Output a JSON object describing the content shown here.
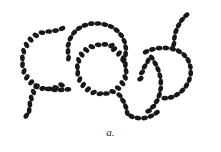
{
  "figure": {
    "caption": "a.",
    "background_color": "#ffffff",
    "cell_color": "#1a1716",
    "cell_count_total": 132,
    "canvas": {
      "width": 221,
      "height": 152
    }
  },
  "chart_data": {
    "type": "scatter",
    "xlabel": "",
    "ylabel": "",
    "xlim": [
      0,
      221
    ],
    "ylim": [
      0,
      152
    ],
    "grid": false,
    "legend": "none",
    "marker_shape": "ellipse",
    "marker_color": "#1a1716",
    "marker_rx": 3.4,
    "marker_ry": 2.35,
    "annotations": [
      "a."
    ],
    "series": [
      {
        "name": "chain-1-left-loop",
        "description": "open C-shaped loop at left, opening to the lower-right, with a tail trailing down-left",
        "points": [
          [
            62.0,
            28.5,
            -22
          ],
          [
            55.5,
            30.6,
            -12
          ],
          [
            48.7,
            31.5,
            -2
          ],
          [
            42.0,
            32.6,
            12
          ],
          [
            35.8,
            35.4,
            30
          ],
          [
            30.6,
            39.6,
            45
          ],
          [
            26.5,
            45.0,
            60
          ],
          [
            23.7,
            51.2,
            74
          ],
          [
            22.4,
            57.9,
            86
          ],
          [
            22.5,
            64.7,
            96
          ],
          [
            24.0,
            71.3,
            108
          ],
          [
            26.9,
            77.3,
            122
          ],
          [
            31.2,
            82.4,
            136
          ],
          [
            36.6,
            86.2,
            150
          ],
          [
            42.7,
            88.4,
            166
          ],
          [
            49.2,
            88.9,
            178
          ],
          [
            55.6,
            87.6,
            193
          ],
          [
            61.5,
            85.0,
            205
          ]
        ]
      },
      {
        "name": "chain-1-tail-lower-left",
        "description": "short tail descending from the left loop toward the bottom-left corner",
        "points": [
          [
            36.4,
            86.2,
            55
          ],
          [
            33.5,
            92.0,
            66
          ],
          [
            31.3,
            98.0,
            76
          ],
          [
            29.9,
            104.2,
            84
          ],
          [
            29.2,
            110.5,
            92
          ],
          [
            26.3,
            115.6,
            125
          ]
        ]
      },
      {
        "name": "chain-1-tail-lower-right",
        "description": "short tail running right from the left loop base",
        "points": [
          [
            48.0,
            89.0,
            5
          ],
          [
            54.6,
            89.8,
            0
          ],
          [
            61.3,
            89.9,
            -4
          ],
          [
            67.9,
            89.3,
            -6
          ]
        ]
      },
      {
        "name": "chain-2-top-arc",
        "description": "large arch across the top-center, descending on the right into the middle loop region",
        "points": [
          [
            68.5,
            58.2,
            -80
          ],
          [
            68.0,
            51.4,
            -84
          ],
          [
            68.3,
            44.6,
            -70
          ],
          [
            70.4,
            38.2,
            -58
          ],
          [
            74.1,
            32.6,
            -44
          ],
          [
            79.1,
            28.2,
            -30
          ],
          [
            85.0,
            25.2,
            -18
          ],
          [
            91.4,
            23.7,
            -8
          ],
          [
            98.1,
            23.5,
            2
          ],
          [
            104.7,
            24.5,
            12
          ],
          [
            111.0,
            26.6,
            22
          ],
          [
            116.6,
            30.2,
            34
          ],
          [
            121.1,
            35.1,
            48
          ],
          [
            124.2,
            41.0,
            62
          ],
          [
            125.7,
            47.4,
            78
          ],
          [
            125.6,
            54.0,
            92
          ],
          [
            124.0,
            60.3,
            106
          ]
        ]
      },
      {
        "name": "chain-3-middle-loop",
        "description": "closed circular loop in the center of the field",
        "points": [
          [
            111.5,
            45.6,
            -30
          ],
          [
            104.9,
            44.4,
            -8
          ],
          [
            98.2,
            44.8,
            8
          ],
          [
            91.8,
            46.7,
            22
          ],
          [
            86.2,
            50.0,
            38
          ],
          [
            81.7,
            54.6,
            54
          ],
          [
            78.7,
            60.3,
            70
          ],
          [
            77.4,
            66.7,
            84
          ],
          [
            77.7,
            73.2,
            96
          ],
          [
            79.7,
            79.5,
            110
          ],
          [
            83.2,
            85.0,
            124
          ],
          [
            87.9,
            89.4,
            138
          ],
          [
            93.6,
            92.4,
            152
          ],
          [
            99.9,
            93.8,
            168
          ],
          [
            106.4,
            93.5,
            182
          ],
          [
            112.6,
            91.5,
            196
          ],
          [
            118.1,
            88.0,
            212
          ],
          [
            122.4,
            83.2,
            228
          ],
          [
            125.2,
            77.4,
            244
          ],
          [
            126.1,
            71.1,
            260
          ],
          [
            125.4,
            64.7,
            276
          ],
          [
            122.9,
            58.7,
            292
          ],
          [
            119.0,
            53.5,
            308
          ],
          [
            114.1,
            49.1,
            322
          ]
        ]
      },
      {
        "name": "chain-3-tail-bottom",
        "description": "tail leaving the middle loop at lower-right and sweeping down and right",
        "points": [
          [
            119.5,
            95.3,
            40
          ],
          [
            123.0,
            100.8,
            52
          ],
          [
            125.7,
            106.7,
            66
          ],
          [
            127.2,
            112.9,
            80
          ],
          [
            131.5,
            116.4,
            30
          ],
          [
            137.8,
            118.0,
            8
          ],
          [
            144.5,
            118.0,
            -8
          ],
          [
            150.9,
            116.1,
            -22
          ],
          [
            156.6,
            112.7,
            -36
          ]
        ]
      },
      {
        "name": "chain-4-right-loop",
        "description": "hook shaped chain on the right, curving from upper-left down and around to the lower-right",
        "points": [
          [
            146.0,
            51.8,
            -26
          ],
          [
            152.4,
            49.4,
            -14
          ],
          [
            159.1,
            48.2,
            -4
          ],
          [
            165.9,
            48.0,
            6
          ],
          [
            172.6,
            48.9,
            18
          ],
          [
            178.9,
            51.2,
            32
          ],
          [
            184.3,
            55.1,
            48
          ],
          [
            188.2,
            60.4,
            64
          ],
          [
            190.3,
            66.6,
            78
          ],
          [
            190.7,
            73.2,
            92
          ],
          [
            189.3,
            79.6,
            106
          ],
          [
            186.4,
            85.5,
            120
          ],
          [
            182.2,
            90.6,
            134
          ],
          [
            177.0,
            94.6,
            148
          ],
          [
            171.1,
            97.2,
            162
          ],
          [
            164.8,
            98.2,
            176
          ]
        ]
      },
      {
        "name": "chain-4-tail-up",
        "description": "vertical tail rising from the right hook toward the top-right corner",
        "points": [
          [
            173.8,
            44.2,
            -72
          ],
          [
            174.5,
            37.6,
            -80
          ],
          [
            176.0,
            31.2,
            -66
          ],
          [
            178.6,
            25.2,
            -58
          ],
          [
            182.0,
            19.8,
            -50
          ],
          [
            186.3,
            15.2,
            -40
          ]
        ]
      },
      {
        "name": "chain-5-right-lower-arc",
        "description": "arc at mid-right running from the junction down-left then curving to the bottom",
        "points": [
          [
            151.8,
            57.6,
            52
          ],
          [
            155.2,
            63.4,
            58
          ],
          [
            158.0,
            69.4,
            66
          ],
          [
            159.9,
            75.7,
            78
          ],
          [
            160.8,
            82.2,
            90
          ],
          [
            160.6,
            88.8,
            102
          ],
          [
            159.2,
            95.2,
            114
          ],
          [
            156.7,
            101.2,
            128
          ],
          [
            153.1,
            106.6,
            142
          ],
          [
            148.6,
            111.0,
            158
          ]
        ]
      },
      {
        "name": "chain-5-lower-left-branch",
        "description": "short branch dropping to the lower left from the right arc junction",
        "points": [
          [
            148.0,
            60.8,
            112
          ],
          [
            144.6,
            66.4,
            122
          ],
          [
            142.0,
            72.4,
            134
          ],
          [
            140.4,
            78.7,
            146
          ]
        ]
      }
    ]
  }
}
